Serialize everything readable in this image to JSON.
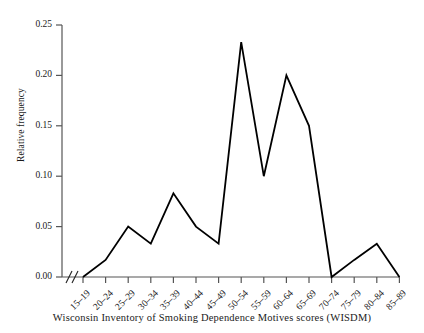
{
  "chart_data": {
    "type": "line",
    "title": "",
    "xlabel": "Wisconsin Inventory of Smoking Dependence Motives scores (WISDM)",
    "ylabel": "Relative frequency",
    "categories": [
      "15–19",
      "20–24",
      "25–29",
      "30–34",
      "35–39",
      "40–44",
      "45–49",
      "50–54",
      "55–59",
      "60–64",
      "65–69",
      "70–74",
      "75–79",
      "80–84",
      "85–89"
    ],
    "values": [
      0.0,
      0.017,
      0.05,
      0.033,
      0.083,
      0.05,
      0.033,
      0.233,
      0.1,
      0.2,
      0.15,
      0.0,
      0.017,
      0.033,
      0.0
    ],
    "ylim": [
      0.0,
      0.25
    ],
    "ytick_values": [
      0.0,
      0.05,
      0.1,
      0.15,
      0.2,
      0.25
    ],
    "ytick_labels": [
      "0.00",
      "0.05",
      "0.10",
      "0.15",
      "0.20",
      "0.25"
    ],
    "grid": false,
    "legend": "none",
    "axis_break": "x-axis broken near origin (zigzag)",
    "line_color": "#000000",
    "axis_color": "#555555"
  },
  "axes": {
    "y_axis_title": "Relative frequency",
    "x_axis_title": "Wisconsin Inventory of Smoking Dependence Motives scores (WISDM)"
  }
}
